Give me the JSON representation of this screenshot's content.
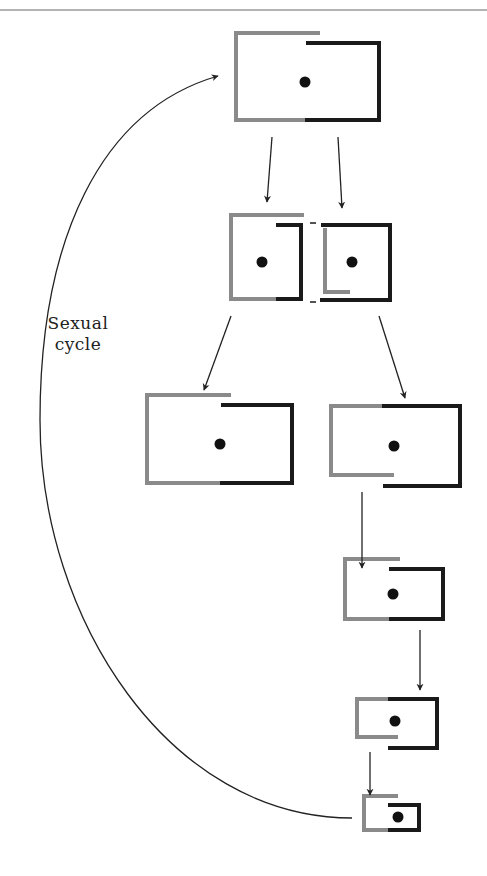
{
  "figure": {
    "type": "diagram",
    "cycle_label_line1": "Sexual",
    "cycle_label_line2": "cycle",
    "colors": {
      "old_wall": "#8a8a8a",
      "new_wall": "#1a1a1a",
      "nucleus": "#111111",
      "arrow": "#222222",
      "top_rule": "#9a9a9a"
    },
    "cells": [
      {
        "id": "cell-1",
        "stage": "parent cell",
        "nucleus": true
      },
      {
        "id": "cell-2a",
        "stage": "daughter left",
        "nucleus": true
      },
      {
        "id": "cell-2b",
        "stage": "daughter right",
        "nucleus": true
      },
      {
        "id": "cell-3a",
        "stage": "grown left daughter",
        "nucleus": true
      },
      {
        "id": "cell-3b",
        "stage": "grown right daughter",
        "nucleus": true
      },
      {
        "id": "cell-4",
        "stage": "smaller cell",
        "nucleus": true
      },
      {
        "id": "cell-5",
        "stage": "smaller cell",
        "nucleus": true
      },
      {
        "id": "cell-6",
        "stage": "smallest cell",
        "nucleus": true
      }
    ]
  }
}
